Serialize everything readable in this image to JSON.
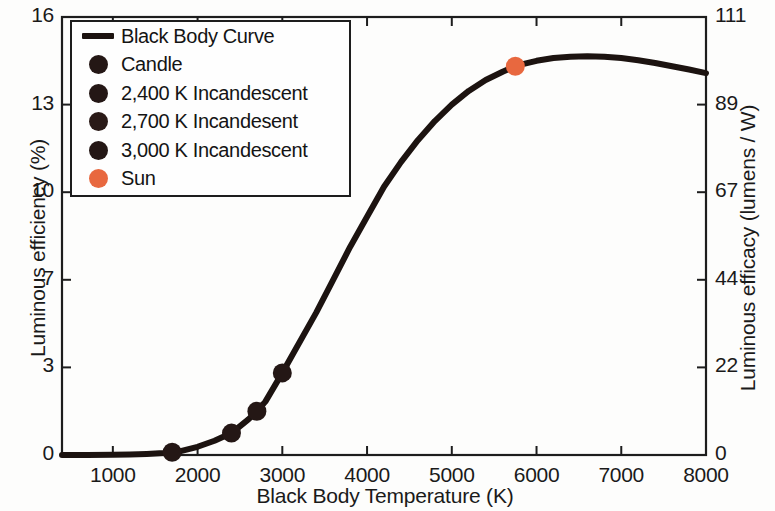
{
  "chart_data": {
    "type": "line",
    "title": "",
    "xlabel": "Black Body Temperature (K)",
    "ylabel": "Luminous efficiency (%)",
    "y2label": "Luminous efficacy (lumens / W)",
    "xlim": [
      400,
      8000
    ],
    "ylim": [
      0,
      16
    ],
    "y2lim": [
      0,
      111
    ],
    "grid": false,
    "legend_position": "upper-left",
    "xticks": [
      1000,
      2000,
      3000,
      4000,
      5000,
      6000,
      7000,
      8000
    ],
    "xticklabels": [
      "1000",
      "2000",
      "3000",
      "4000",
      "5000",
      "6000",
      "7000",
      "8000"
    ],
    "yticks": [
      0,
      3,
      7,
      10,
      13,
      16
    ],
    "yticklabels": [
      "0",
      "3",
      "7",
      "10",
      "13",
      "16"
    ],
    "y2ticks": [
      0,
      22,
      44,
      67,
      89,
      111
    ],
    "y2ticklabels": [
      "0",
      "22",
      "44",
      "67",
      "89",
      "111"
    ],
    "series": [
      {
        "name": "Black Body Curve",
        "type": "line",
        "color": "#1c1310",
        "linewidth": 6,
        "x": [
          400,
          700,
          1000,
          1200,
          1400,
          1600,
          1700,
          1800,
          2000,
          2200,
          2400,
          2600,
          2700,
          2800,
          3000,
          3200,
          3400,
          3600,
          3800,
          4000,
          4200,
          4400,
          4600,
          4800,
          5000,
          5200,
          5400,
          5600,
          5750,
          5800,
          6000,
          6200,
          6400,
          6600,
          6800,
          7000,
          7200,
          7400,
          7600,
          7800,
          8000
        ],
        "y": [
          0.0,
          0.0,
          0.01,
          0.02,
          0.04,
          0.07,
          0.1,
          0.14,
          0.3,
          0.52,
          0.8,
          1.3,
          1.6,
          1.95,
          3.0,
          4.1,
          5.2,
          6.4,
          7.6,
          8.7,
          9.8,
          10.7,
          11.5,
          12.2,
          12.8,
          13.3,
          13.7,
          14.0,
          14.2,
          14.25,
          14.4,
          14.5,
          14.55,
          14.57,
          14.55,
          14.5,
          14.42,
          14.32,
          14.2,
          14.08,
          13.95
        ]
      }
    ],
    "points": [
      {
        "name": "Candle",
        "x": 1700,
        "y": 0.1,
        "color": "#241715",
        "size": 19
      },
      {
        "name": "2,400 K Incandescent",
        "x": 2400,
        "y": 0.8,
        "color": "#241715",
        "size": 19
      },
      {
        "name": "2,700 K Incandesent",
        "x": 2700,
        "y": 1.6,
        "color": "#241715",
        "size": 19
      },
      {
        "name": "3,000 K Incandescent",
        "x": 3000,
        "y": 3.0,
        "color": "#241715",
        "size": 19
      },
      {
        "name": "Sun",
        "x": 5750,
        "y": 14.2,
        "color": "#e8683f",
        "size": 19
      }
    ],
    "legend": [
      {
        "label": "Black Body Curve",
        "marker": "line",
        "color": "#1c1310"
      },
      {
        "label": "Candle",
        "marker": "dot",
        "color": "#241715"
      },
      {
        "label": "2,400 K Incandescent",
        "marker": "dot",
        "color": "#241715"
      },
      {
        "label": "2,700 K Incandesent",
        "marker": "dot",
        "color": "#2a1a17"
      },
      {
        "label": "3,000 K Incandescent",
        "marker": "dot",
        "color": "#241715"
      },
      {
        "label": "Sun",
        "marker": "dot",
        "color": "#e8683f"
      }
    ]
  },
  "axes": {
    "x_title": "Black Body Temperature (K)",
    "y_left_title": "Luminous efficiency (%)",
    "y_right_title": "Luminous efficacy (lumens / W)",
    "y_left_ticks": [
      "16",
      "13",
      "10",
      "7",
      "3",
      "0"
    ],
    "y_right_ticks": [
      "111",
      "89",
      "67",
      "44",
      "22",
      "0"
    ],
    "x_ticks": [
      "1000",
      "2000",
      "3000",
      "4000",
      "5000",
      "6000",
      "7000",
      "8000"
    ]
  },
  "legend": {
    "rows": [
      {
        "label": "Black Body Curve"
      },
      {
        "label": "Candle"
      },
      {
        "label": "2,400 K Incandescent"
      },
      {
        "label": "2,700 K Incandesent"
      },
      {
        "label": "3,000 K Incandescent"
      },
      {
        "label": "Sun"
      }
    ]
  },
  "colors": {
    "curve": "#1c1310",
    "marker_dark": "#241715",
    "marker_sun": "#e8683f",
    "axis": "#1d1d1d",
    "text": "#141414",
    "background": "#fdfdfc"
  }
}
